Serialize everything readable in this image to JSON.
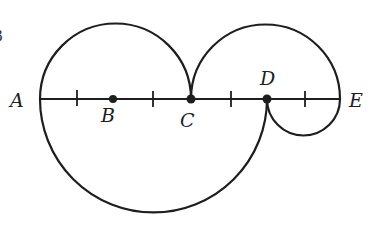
{
  "figure": {
    "clipped_margin_glyph": "3",
    "stroke_color": "#1e1e1e",
    "background_color": "#ffffff",
    "segment": {
      "from": "A",
      "to": "E",
      "tick_count": 4
    },
    "points": [
      {
        "label": "A",
        "role": "left endpoint"
      },
      {
        "label": "B",
        "role": "marked point (dot)"
      },
      {
        "label": "C",
        "role": "marked point (dot)"
      },
      {
        "label": "D",
        "role": "marked point (dot)"
      },
      {
        "label": "E",
        "role": "right endpoint"
      }
    ],
    "arcs": [
      {
        "name": "upper-left-semicircle",
        "from": "A",
        "to": "C",
        "side": "above"
      },
      {
        "name": "upper-right-semicircle",
        "from": "C",
        "to": "E",
        "side": "above"
      },
      {
        "name": "lower-large-semicircle",
        "from": "A",
        "to": "D",
        "side": "below"
      },
      {
        "name": "lower-small-semicircle",
        "from": "D",
        "to": "E",
        "side": "below"
      }
    ]
  },
  "labels": {
    "A": "A",
    "B": "B",
    "C": "C",
    "D": "D",
    "E": "E"
  }
}
